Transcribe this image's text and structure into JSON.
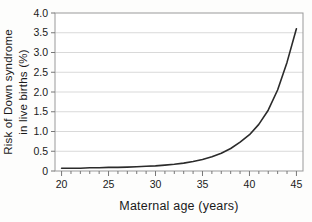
{
  "chart_data": {
    "type": "line",
    "title": "",
    "xlabel": "Maternal age (years)",
    "ylabel": "Risk of Down syndrome in live births (%)",
    "ylabel_lines": [
      "Risk of Down syndrome",
      "in live births (%)"
    ],
    "series": [
      {
        "name": "Risk of Down syndrome in live births",
        "x": [
          20,
          21,
          22,
          23,
          24,
          25,
          26,
          27,
          28,
          29,
          30,
          31,
          32,
          33,
          34,
          35,
          36,
          37,
          38,
          39,
          40,
          41,
          42,
          43,
          44,
          45
        ],
        "y": [
          0.07,
          0.07,
          0.07,
          0.08,
          0.08,
          0.09,
          0.09,
          0.1,
          0.11,
          0.12,
          0.13,
          0.15,
          0.17,
          0.2,
          0.24,
          0.29,
          0.36,
          0.45,
          0.57,
          0.73,
          0.92,
          1.18,
          1.54,
          2.05,
          2.75,
          3.6
        ]
      }
    ],
    "xlim": [
      19.3,
      45.7
    ],
    "ylim": [
      0,
      4.0
    ],
    "x_major_ticks": [
      20,
      25,
      30,
      35,
      40,
      45
    ],
    "x_major_tick_labels": [
      "20",
      "25",
      "30",
      "35",
      "40",
      "45"
    ],
    "x_minor_tick_interval": 1,
    "y_tick_values": [
      0,
      0.5,
      1.0,
      1.5,
      2.0,
      2.5,
      3.0,
      3.5,
      4.0
    ],
    "y_tick_labels": [
      "0",
      "0.5",
      "1.0",
      "1.5",
      "2.0",
      "2.5",
      "3.0",
      "3.5",
      "4.0"
    ],
    "grid": "horizontal",
    "legend": "none",
    "colors": {
      "curve": "#2b2b2b",
      "grid": "#d9d9d9",
      "frame": "#999999",
      "tick": "#777777",
      "text": "#1a1a1a",
      "background": "#ffffff"
    }
  }
}
